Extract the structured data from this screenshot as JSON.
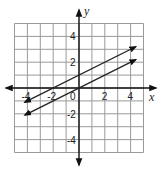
{
  "chart_data": {
    "type": "line",
    "title": "",
    "xlabel": "x",
    "ylabel": "y",
    "xlim": [
      -5,
      5
    ],
    "ylim": [
      -5,
      5
    ],
    "grid": true,
    "x_ticks": [
      -4,
      -2,
      0,
      2,
      4
    ],
    "y_ticks": [
      -4,
      -2,
      2,
      4
    ],
    "x_tick_labels": [
      "-4",
      "-2",
      "0",
      "2",
      "4"
    ],
    "y_tick_labels": [
      "-4",
      "-2",
      "2",
      "4"
    ],
    "series": [
      {
        "name": "y = 0.5x + 1",
        "slope": 0.5,
        "intercept": 1,
        "x": [
          -4.2,
          4.4
        ],
        "y": [
          -1.1,
          3.2
        ],
        "arrows": "both"
      },
      {
        "name": "y = 0.5x",
        "slope": 0.5,
        "intercept": 0,
        "x": [
          -4.2,
          4.4
        ],
        "y": [
          -2.1,
          2.2
        ],
        "arrows": "both"
      }
    ],
    "colors": {
      "grid": "#9a9a9a",
      "axes": "#111111",
      "lines": "#222222"
    }
  },
  "labels": {
    "x_axis": "x",
    "y_axis": "y",
    "origin": "0"
  }
}
